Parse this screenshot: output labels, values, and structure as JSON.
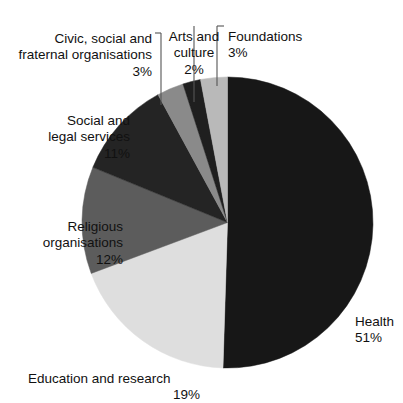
{
  "chart_data": {
    "type": "pie",
    "title": "",
    "subtitle": "",
    "xlabel": "",
    "ylabel": "",
    "legend_position": "labels-with-leader-lines",
    "grid": false,
    "units": "percent",
    "categories": [
      "Health",
      "Education and research",
      "Religious organisations",
      "Social and legal services",
      "Civic, social and fraternal organisations",
      "Arts and culture",
      "Foundations"
    ],
    "values": [
      51,
      19,
      12,
      11,
      3,
      2,
      3
    ],
    "colors": [
      "#171717",
      "#dedede",
      "#5c5c5c",
      "#242424",
      "#8a8a8a",
      "#1f1f1f",
      "#b9b9b9"
    ],
    "slices": [
      {
        "label": "Health",
        "value": 51,
        "value_text": "51%",
        "color": "#171717"
      },
      {
        "label": "Education and research",
        "value": 19,
        "value_text": "19%",
        "color": "#dedede"
      },
      {
        "label": "Religious organisations",
        "value": 12,
        "value_text": "12%",
        "color": "#5c5c5c"
      },
      {
        "label": "Social and legal services",
        "value": 11,
        "value_text": "11%",
        "color": "#242424"
      },
      {
        "label": "Civic, social and fraternal organisations",
        "value": 3,
        "value_text": "3%",
        "color": "#8a8a8a"
      },
      {
        "label": "Arts and culture",
        "value": 2,
        "value_text": "2%",
        "color": "#1f1f1f"
      },
      {
        "label": "Foundations",
        "value": 3,
        "value_text": "3%",
        "color": "#b9b9b9"
      }
    ]
  },
  "labels": {
    "health": {
      "name": "Health",
      "pct": "51%"
    },
    "education": {
      "name": "Education and research",
      "pct": "19%"
    },
    "religious": {
      "name": "Religious\norganisations",
      "pct": "12%"
    },
    "social": {
      "name": "Social and\nlegal services",
      "pct": "11%"
    },
    "civic": {
      "name": "Civic, social and\nfraternal organisations",
      "pct": "3%"
    },
    "arts": {
      "name": "Arts and\nculture",
      "pct": "2%"
    },
    "foundations": {
      "name": "Foundations",
      "pct": "3%"
    }
  },
  "style": {
    "background": "#ffffff",
    "text_color": "#111111",
    "leader_line_color": "#555555"
  }
}
